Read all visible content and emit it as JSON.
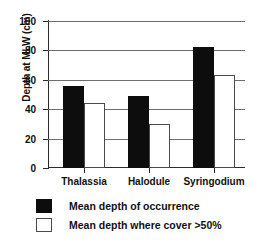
{
  "chart_data": {
    "type": "bar",
    "title": "",
    "xlabel": "",
    "ylabel": "Depth at MLW (cm)",
    "categories": [
      "Thalassia",
      "Halodule",
      "Syringodium"
    ],
    "series": [
      {
        "name": "Mean depth of occurrence",
        "color": "#0d0d0d",
        "values": [
          56,
          49,
          82
        ]
      },
      {
        "name": "Mean depth where cover >50%",
        "color": "#ffffff",
        "values": [
          44,
          30,
          63
        ]
      }
    ],
    "ylim": [
      0,
      100
    ],
    "yticks": [
      0,
      20,
      40,
      60,
      80,
      100
    ],
    "ytick_labels": [
      "0",
      "20",
      "40",
      "60",
      "80",
      "100"
    ],
    "grid": true,
    "legend_position": "bottom-left"
  },
  "axes": {
    "y_title": "Depth at MLW (cm)",
    "y_ticks": [
      {
        "label": "100",
        "value": 100
      },
      {
        "label": "80",
        "value": 80
      },
      {
        "label": "60",
        "value": 60
      },
      {
        "label": "40",
        "value": 40
      },
      {
        "label": "20",
        "value": 20
      },
      {
        "label": "0",
        "value": 0
      }
    ],
    "x_ticks": [
      {
        "label": "Thalassia"
      },
      {
        "label": "Halodule"
      },
      {
        "label": "Syringodium"
      }
    ]
  },
  "legend": {
    "items": [
      {
        "label": "Mean depth of occurrence",
        "swatch": "dark"
      },
      {
        "label": "Mean depth where cover >50%",
        "swatch": "light"
      }
    ]
  }
}
